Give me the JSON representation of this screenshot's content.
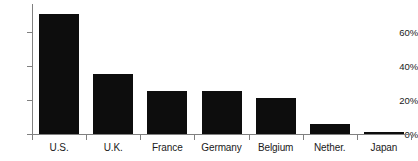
{
  "chart_data": {
    "type": "bar",
    "title": "",
    "subtitle": "",
    "xlabel": "",
    "ylabel": "",
    "categories": [
      "U.S.",
      "U.K.",
      "France",
      "Germany",
      "Belgium",
      "Nether.",
      "Japan"
    ],
    "values": [
      70,
      35,
      25,
      25,
      21,
      6,
      1
    ],
    "ylim": [
      0,
      76
    ],
    "ytick_values": [
      0,
      20,
      40,
      60
    ],
    "ytick_labels": [
      "0%",
      "20%",
      "40%",
      "60%"
    ],
    "grid": false,
    "legend": null,
    "series": [
      {
        "name": "",
        "values": [
          70,
          35,
          25,
          25,
          21,
          6,
          1
        ]
      }
    ],
    "bar_color": "#0d0d0d",
    "axis_color": "#808080",
    "background_color": "#ffffff",
    "orientation": "vertical"
  }
}
